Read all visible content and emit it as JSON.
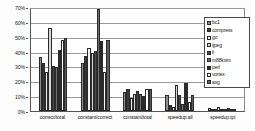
{
  "chart_data": {
    "type": "bar",
    "title": "",
    "xlabel": "",
    "ylabel": "",
    "ylim": [
      0,
      70
    ],
    "grid": true,
    "legend_position": "right-inside",
    "y_ticks": [
      "0%",
      "10%",
      "20%",
      "30%",
      "40%",
      "50%",
      "60%",
      "70%"
    ],
    "y_tick_values": [
      0,
      10,
      20,
      30,
      40,
      50,
      60,
      70
    ],
    "categories": [
      "correct/total",
      "constant/correct",
      "constant/total",
      "speedup:all",
      "speedup:tpi"
    ],
    "series": [
      {
        "name": "bc1",
        "color": "#8f8f8f",
        "values": [
          37,
          33,
          13,
          11,
          2.0
        ]
      },
      {
        "name": "compress",
        "color": "#3a3a3a",
        "values": [
          33,
          38,
          15,
          4,
          1.2
        ]
      },
      {
        "name": "go",
        "color": "#f2f2f2",
        "values": [
          27,
          43,
          9,
          3,
          0.8
        ]
      },
      {
        "name": "ijpeg",
        "color": "#d8d8d8",
        "values": [
          57,
          40,
          12,
          18,
          2.6
        ]
      },
      {
        "name": "li",
        "color": "#4a4a4a",
        "values": [
          31,
          41,
          14,
          11,
          1.1
        ]
      },
      {
        "name": "m88ksim",
        "color": "#707070",
        "values": [
          30,
          70,
          12,
          5,
          0.9
        ]
      },
      {
        "name": "perl",
        "color": "#2b2b2b",
        "values": [
          42,
          48,
          10,
          19,
          2.2
        ]
      },
      {
        "name": "vortex",
        "color": "#ffffff",
        "values": [
          49,
          27,
          15,
          6,
          1.0
        ]
      },
      {
        "name": "avg",
        "color": "#5e5e5e",
        "values": [
          50,
          49,
          15,
          11,
          1.6
        ]
      }
    ]
  }
}
